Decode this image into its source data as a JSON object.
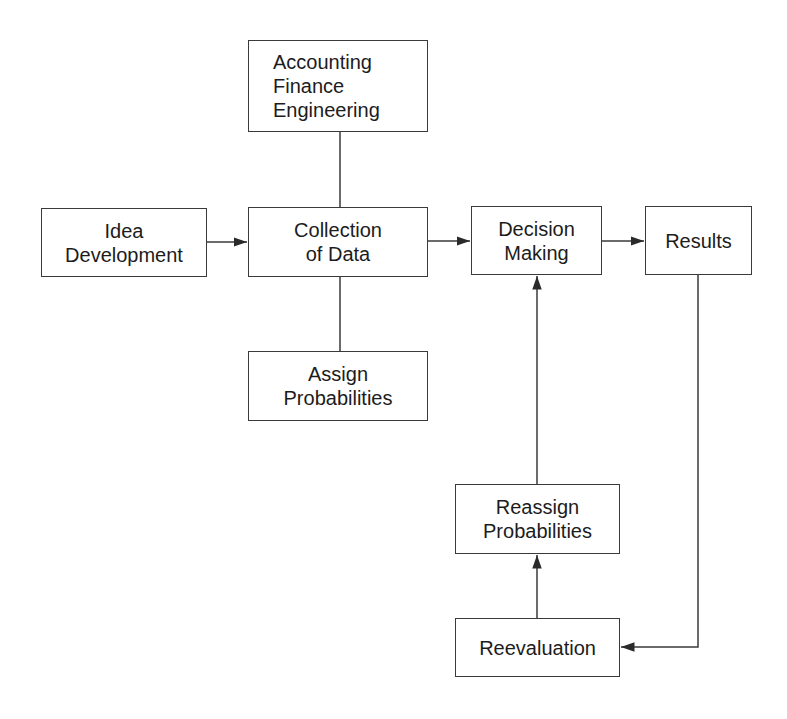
{
  "title_fragment": "",
  "nodes": {
    "accounting": {
      "lines": [
        "Accounting",
        "Finance",
        "Engineering"
      ]
    },
    "idea": {
      "lines": [
        "Idea",
        "Development"
      ]
    },
    "collection": {
      "lines": [
        "Collection",
        "of Data"
      ]
    },
    "decision": {
      "lines": [
        "Decision",
        "Making"
      ]
    },
    "results": {
      "lines": [
        "Results"
      ]
    },
    "assign": {
      "lines": [
        "Assign",
        "Probabilities"
      ]
    },
    "reassign": {
      "lines": [
        "Reassign",
        "Probabilities"
      ]
    },
    "reevaluation": {
      "lines": [
        "Reevaluation"
      ]
    }
  },
  "edges": [
    {
      "from": "idea",
      "to": "collection",
      "type": "arrow"
    },
    {
      "from": "collection",
      "to": "decision",
      "type": "arrow"
    },
    {
      "from": "decision",
      "to": "results",
      "type": "arrow"
    },
    {
      "from": "accounting",
      "to": "collection",
      "type": "line"
    },
    {
      "from": "collection",
      "to": "assign",
      "type": "line"
    },
    {
      "from": "results",
      "to": "reevaluation",
      "type": "arrow"
    },
    {
      "from": "reevaluation",
      "to": "reassign",
      "type": "arrow"
    },
    {
      "from": "reassign",
      "to": "decision",
      "type": "arrow"
    }
  ],
  "colors": {
    "stroke": "#3a3a3a",
    "text": "#1c1c1c",
    "background": "#ffffff"
  }
}
